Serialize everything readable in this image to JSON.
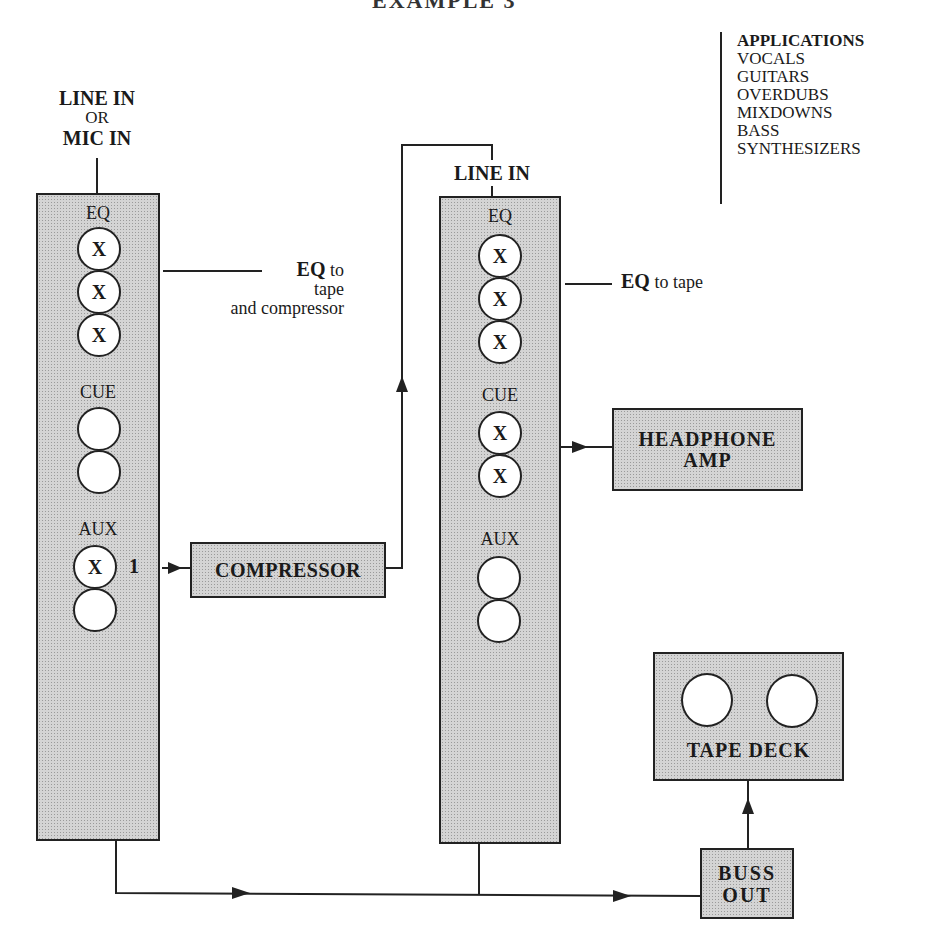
{
  "title_cut": "EXAMPLE 3",
  "applications": {
    "heading": "APPLICATIONS",
    "items": [
      "VOCALS",
      "GUITARS",
      "OVERDUBS",
      "MIXDOWNS",
      "BASS",
      "SYNTHESIZERS"
    ]
  },
  "strip1": {
    "input_label_line1": "LINE IN",
    "input_label_line2": "OR",
    "input_label_line3": "MIC IN",
    "eq_label": "EQ",
    "eq_knobs": [
      "X",
      "X",
      "X"
    ],
    "cue_label": "CUE",
    "cue_knobs": [
      "",
      ""
    ],
    "aux_label": "AUX",
    "aux_knobs": [
      "X",
      ""
    ],
    "aux_send_number": "1",
    "eq_note_bold": "EQ",
    "eq_note_line1": "to",
    "eq_note_line2": "tape",
    "eq_note_line3": "and compressor"
  },
  "strip2": {
    "input_label": "LINE IN",
    "eq_label": "EQ",
    "eq_knobs": [
      "X",
      "X",
      "X"
    ],
    "cue_label": "CUE",
    "cue_knobs": [
      "X",
      "X"
    ],
    "aux_label": "AUX",
    "aux_knobs": [
      "",
      ""
    ],
    "eq_note_bold": "EQ",
    "eq_note_rest": "to tape"
  },
  "compressor": {
    "label": "COMPRESSOR"
  },
  "headphone_amp": {
    "line1": "HEADPHONE",
    "line2": "AMP"
  },
  "tape_deck": {
    "label": "TAPE DECK"
  },
  "buss_out": {
    "line1": "BUSS",
    "line2": "OUT"
  },
  "colors": {
    "line": "#222222",
    "fill": "#d4d4d4",
    "background": "#ffffff"
  }
}
